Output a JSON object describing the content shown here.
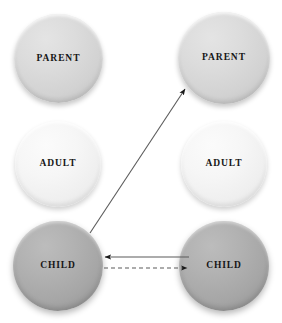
{
  "diagram": {
    "background_color": "#ffffff",
    "width": 282,
    "height": 323,
    "persons": [
      {
        "id": "person-left",
        "side": "left"
      },
      {
        "id": "person-right",
        "side": "right"
      }
    ],
    "ego_states": [
      {
        "id": "parent-left",
        "label": "PARENT",
        "person": "left",
        "row": "parent",
        "fill_color": "#d6d6d6",
        "cx": 58,
        "cy": 58,
        "diameter": 89
      },
      {
        "id": "parent-right",
        "label": "PARENT",
        "person": "right",
        "row": "parent",
        "fill_color": "#d6d6d6",
        "cx": 224,
        "cy": 58,
        "diameter": 92
      },
      {
        "id": "adult-left",
        "label": "ADULT",
        "person": "left",
        "row": "adult",
        "fill_color": "#f1f1f1",
        "cx": 58,
        "cy": 164,
        "diameter": 86
      },
      {
        "id": "adult-right",
        "label": "ADULT",
        "person": "right",
        "row": "adult",
        "fill_color": "#f1f1f1",
        "cx": 224,
        "cy": 164,
        "diameter": 86
      },
      {
        "id": "child-left",
        "label": "CHILD",
        "person": "left",
        "row": "child",
        "fill_color": "#a9a9a9",
        "cx": 58,
        "cy": 266,
        "diameter": 90
      },
      {
        "id": "child-right",
        "label": "CHILD",
        "person": "right",
        "row": "child",
        "fill_color": "#a9a9a9",
        "cx": 224,
        "cy": 266,
        "diameter": 90
      }
    ],
    "transactions": [
      {
        "id": "transaction-child-left-to-parent-right",
        "style": "solid",
        "color": "#5b5b5b",
        "from": "child-left",
        "to": "parent-right",
        "x1": 90,
        "y1": 233,
        "x2": 185,
        "y2": 89,
        "arrowhead": "end"
      },
      {
        "id": "transaction-child-right-to-child-left",
        "style": "solid",
        "color": "#5b5b5b",
        "from": "child-right",
        "to": "child-left",
        "x1": 189,
        "y1": 257,
        "x2": 104,
        "y2": 257,
        "arrowhead": "end"
      },
      {
        "id": "transaction-child-left-to-child-right",
        "style": "dashed",
        "color": "#5b5b5b",
        "from": "child-left",
        "to": "child-right",
        "x1": 104,
        "y1": 268,
        "x2": 188,
        "y2": 268,
        "arrowhead": "end"
      }
    ]
  }
}
